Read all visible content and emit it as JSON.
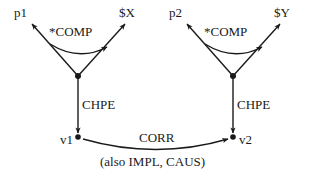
{
  "diagram": {
    "title": "",
    "background_color": "#ffffff",
    "stroke_color": "#1a1a1a",
    "text_color": "#1a1a1a",
    "groups": [
      {
        "name": "left-structure",
        "top_left_node": "p1",
        "top_right_node": "$X",
        "comp_label": "*COMP",
        "chpe_label": "CHPE",
        "bottom_node": "v1"
      },
      {
        "name": "right-structure",
        "top_left_node": "p2",
        "top_right_node": "$Y",
        "comp_label": "*COMP",
        "chpe_label": "CHPE",
        "bottom_node": "v2"
      }
    ],
    "nodes": {
      "p1": "p1",
      "sx": "$X",
      "p2": "p2",
      "sy": "$Y",
      "v1": "v1",
      "v2": "v2"
    },
    "relations": {
      "comp_left": "*COMP",
      "comp_right": "*COMP",
      "chpe_left": "CHPE",
      "chpe_right": "CHPE",
      "corr": "CORR",
      "corr_alt": "(also IMPL, CAUS)"
    }
  }
}
